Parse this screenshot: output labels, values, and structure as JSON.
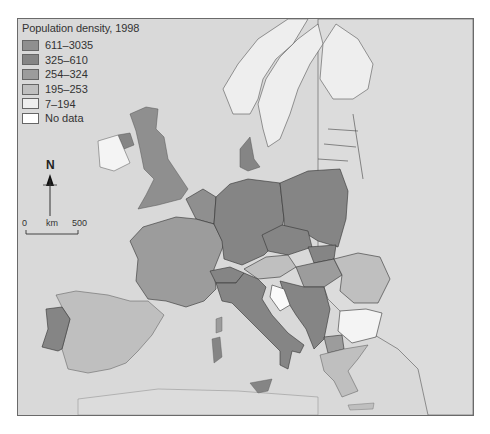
{
  "legend": {
    "title": "Population density, 1998",
    "classes": [
      {
        "label": "611–3035",
        "color": "#8f8f8f"
      },
      {
        "label": "325–610",
        "color": "#858585"
      },
      {
        "label": "254–324",
        "color": "#9c9c9c"
      },
      {
        "label": "195–253",
        "color": "#bfbfbf"
      },
      {
        "label": "7–194",
        "color": "#eeeeee"
      },
      {
        "label": "No data",
        "color": "#ffffff"
      }
    ]
  },
  "scale_bar": {
    "north_label": "N",
    "start_label": "0",
    "unit_label": "km",
    "end_label": "500"
  },
  "colors": {
    "sea": "#d9d9d9",
    "non_eu_land": "#dadada",
    "border": "#3a3a3a"
  },
  "map": {
    "regions": [
      {
        "name": "UK",
        "class": "611–3035"
      },
      {
        "name": "Northern Ireland",
        "class": "325–610"
      },
      {
        "name": "Ireland",
        "class": "7–194"
      },
      {
        "name": "France",
        "class": "254–324"
      },
      {
        "name": "Spain",
        "class": "195–253"
      },
      {
        "name": "Portugal",
        "class": "325–610"
      },
      {
        "name": "Germany",
        "class": "325–610"
      },
      {
        "name": "Poland",
        "class": "325–610"
      },
      {
        "name": "Czech Republic",
        "class": "325–610"
      },
      {
        "name": "Italy",
        "class": "325–610"
      },
      {
        "name": "Austria",
        "class": "195–253"
      },
      {
        "name": "Hungary",
        "class": "254–324"
      },
      {
        "name": "Romania",
        "class": "195–253"
      },
      {
        "name": "Bulgaria",
        "class": "7–194"
      },
      {
        "name": "Greece",
        "class": "195–253"
      },
      {
        "name": "Denmark",
        "class": "325–610"
      },
      {
        "name": "Norway",
        "class": "7–194"
      },
      {
        "name": "Sweden",
        "class": "7–194"
      },
      {
        "name": "Finland",
        "class": "7–194"
      }
    ]
  }
}
